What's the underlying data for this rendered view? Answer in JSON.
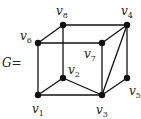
{
  "graph": {
    "name_label": "G=",
    "vertices": [
      {
        "id": "v1",
        "base": "v",
        "sub": "1"
      },
      {
        "id": "v2",
        "base": "v",
        "sub": "2"
      },
      {
        "id": "v3",
        "base": "v",
        "sub": "3"
      },
      {
        "id": "v4",
        "base": "v",
        "sub": "4"
      },
      {
        "id": "v5",
        "base": "v",
        "sub": "5"
      },
      {
        "id": "v6",
        "base": "v",
        "sub": "6"
      },
      {
        "id": "v7",
        "base": "v",
        "sub": "7"
      },
      {
        "id": "v8",
        "base": "v",
        "sub": "8"
      }
    ],
    "edges": [
      [
        "v6",
        "v8"
      ],
      [
        "v8",
        "v4"
      ],
      [
        "v6",
        "v7"
      ],
      [
        "v7",
        "v4"
      ],
      [
        "v6",
        "v1"
      ],
      [
        "v8",
        "v2"
      ],
      [
        "v7",
        "v3"
      ],
      [
        "v4",
        "v3"
      ],
      [
        "v4",
        "v5"
      ],
      [
        "v5",
        "v3"
      ],
      [
        "v1",
        "v2"
      ],
      [
        "v2",
        "v3"
      ],
      [
        "v1",
        "v3"
      ]
    ]
  }
}
